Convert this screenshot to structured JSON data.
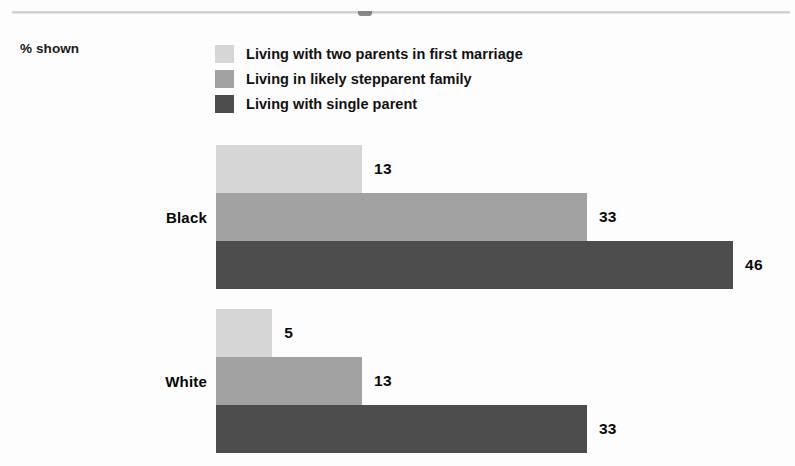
{
  "chart_data": {
    "type": "bar",
    "orientation": "horizontal",
    "title": "",
    "subtitle": "",
    "unit_note": "% shown",
    "xlabel": "",
    "ylabel": "",
    "categories": [
      "Black",
      "White"
    ],
    "series": [
      {
        "name": "Living with two parents in first marriage",
        "color": "#d6d6d6",
        "values": [
          13,
          5
        ]
      },
      {
        "name": "Living in likely stepparent family",
        "color": "#a2a2a2",
        "values": [
          33,
          13
        ]
      },
      {
        "name": "Living with single parent",
        "color": "#4d4d4d",
        "values": [
          46,
          33
        ]
      }
    ],
    "xlim": [
      0,
      46
    ],
    "grid": false,
    "legend_position": "top",
    "data_labels": true
  },
  "legend": {
    "items": [
      {
        "label": "Living with two parents in first marriage",
        "color": "#d6d6d6"
      },
      {
        "label": "Living in likely stepparent family",
        "color": "#a2a2a2"
      },
      {
        "label": "Living with single parent",
        "color": "#4d4d4d"
      }
    ]
  },
  "axis": {
    "unit_note": "% shown"
  },
  "groups": [
    {
      "label": "Black",
      "bars": [
        {
          "series": "Living with two parents in first marriage",
          "value": 13,
          "value_label": "13",
          "color": "#d6d6d6"
        },
        {
          "series": "Living in likely stepparent family",
          "value": 33,
          "value_label": "33",
          "color": "#a2a2a2"
        },
        {
          "series": "Living with single parent",
          "value": 46,
          "value_label": "46",
          "color": "#4d4d4d"
        }
      ]
    },
    {
      "label": "White",
      "bars": [
        {
          "series": "Living with two parents in first marriage",
          "value": 5,
          "value_label": "5",
          "color": "#d6d6d6"
        },
        {
          "series": "Living in likely stepparent family",
          "value": 13,
          "value_label": "13",
          "color": "#a2a2a2"
        },
        {
          "series": "Living with single parent",
          "value": 33,
          "value_label": "33",
          "color": "#4d4d4d"
        }
      ]
    }
  ],
  "colors": {
    "light": "#d6d6d6",
    "medium": "#a2a2a2",
    "dark": "#4d4d4d",
    "text": "#0a0a0a",
    "rule": "#bfbfbf",
    "background": "#fdfdfd"
  }
}
